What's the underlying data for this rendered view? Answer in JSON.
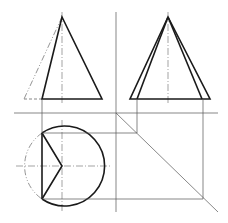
{
  "diagram": {
    "type": "orthographic-projection",
    "colors": {
      "line": "#1a1a1a",
      "construction": "#555555",
      "background": "#ffffff"
    },
    "views": {
      "front": {
        "apex": [
          62,
          17
        ],
        "base_y": 99,
        "base_left": 42,
        "base_right": 102,
        "phantom_left": 24,
        "axis_x": 62
      },
      "side": {
        "apex": [
          168,
          17
        ],
        "base_y": 99,
        "outer_left": 130,
        "outer_right": 210,
        "inner_left": 137,
        "inner_right": 202,
        "axis_x": 168
      },
      "top": {
        "center": [
          62,
          166
        ],
        "radius": 40,
        "chord_x": 42,
        "chord_top": 133,
        "chord_bottom": 199
      }
    },
    "construction": {
      "divider_x": 116,
      "horizontal_ref_y": 113,
      "miter_line": [
        [
          116,
          113
        ],
        [
          218,
          212
        ]
      ]
    }
  }
}
